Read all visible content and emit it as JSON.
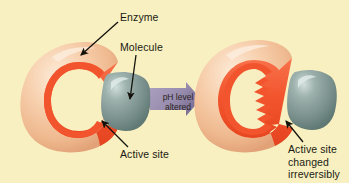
{
  "figure": {
    "background_color": "#f8f0c0",
    "frame_color": "#ffffff"
  },
  "labels": {
    "enzyme": "Enzyme",
    "molecule": "Molecule",
    "active_site_left": "Active site",
    "active_site_right": "Active site\nchanged\nirreversibly",
    "ph_arrow": "pH level\naltered"
  },
  "colors": {
    "background": "#f8f0c0",
    "enzyme_body": "#f2c49c",
    "enzyme_body_light": "#fbe3cd",
    "enzyme_body_shadow": "#e0a477",
    "active_site_red": "#f0502a",
    "active_site_red_light": "#f87a52",
    "molecule": "#7d9490",
    "molecule_light": "#b9cbc6",
    "molecule_shadow": "#5c7470",
    "arrow_black": "#14120c",
    "ph_arrow_fill": "#8c7aa8",
    "text": "#1a1a14"
  },
  "elements": {
    "left_panel": {
      "name": "normal-enzyme-substrate-complex",
      "enzyme_shape": "smooth C-shape",
      "active_site_shape": "smooth",
      "molecule_attached": true
    },
    "right_panel": {
      "name": "denatured-enzyme",
      "enzyme_shape": "C-shape with jagged lining",
      "active_site_shape": "jagged-irreversibly-changed",
      "molecule_attached": false
    },
    "ph_arrow": {
      "name": "ph-change-arrow",
      "direction": "right"
    }
  },
  "annotations": [
    {
      "name": "enzyme-pointer",
      "from": [
        118,
        22
      ],
      "to": [
        79,
        56
      ]
    },
    {
      "name": "molecule-pointer",
      "from": [
        135,
        55
      ],
      "to": [
        129,
        99
      ]
    },
    {
      "name": "active-site-pointer-left",
      "from": [
        128,
        146
      ],
      "to": [
        101,
        120
      ]
    },
    {
      "name": "active-site-pointer-right",
      "from": [
        303,
        142
      ],
      "to": [
        285,
        120
      ]
    }
  ]
}
